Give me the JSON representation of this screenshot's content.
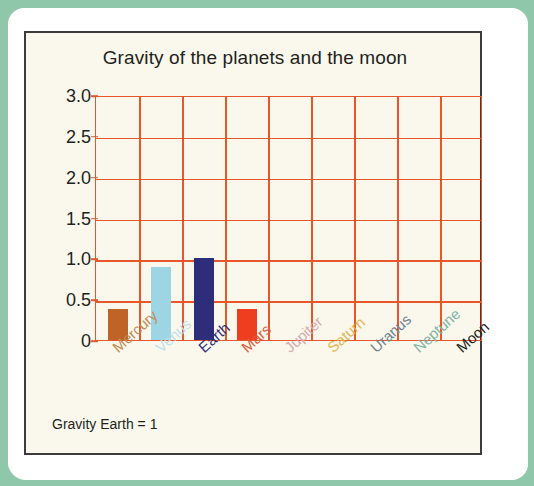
{
  "page": {
    "background_color": "#8fc7ab",
    "card_color": "#ffffff"
  },
  "panel": {
    "background_color": "#faf8ec",
    "border_color": "#3c3c3c",
    "footnote": "Gravity Earth = 1"
  },
  "chart_data": {
    "type": "bar",
    "title": "Gravity of the planets and the moon",
    "xlabel": "",
    "ylabel": "",
    "ylim": [
      0,
      3.0
    ],
    "yticks": [
      0,
      0.5,
      1.0,
      1.5,
      2.0,
      2.5,
      3.0
    ],
    "ytick_labels": [
      "0",
      "0.5",
      "1.0",
      "1.5",
      "2.0",
      "2.5",
      "3.0"
    ],
    "grid": true,
    "grid_color": "#e8572a",
    "legend": "none",
    "annotation": "Gravity Earth = 1",
    "categories": [
      "Mercury",
      "Venus",
      "Earth",
      "Mars",
      "Jupiter",
      "Saturn",
      "Uranus",
      "Neptune",
      "Moon"
    ],
    "values": [
      0.38,
      0.9,
      1.0,
      0.38,
      0,
      0,
      0,
      0,
      0
    ],
    "bar_colors": [
      "#bf6327",
      "#9ed5e5",
      "#2e2d7a",
      "#ef3d20",
      "#d9a7a7",
      "#e8c266",
      "#6c7b8b",
      "#7fb3a8",
      "#231f20"
    ],
    "label_colors": [
      "#c08b55",
      "#bfdfe9",
      "#2e2d7a",
      "#e2583a",
      "#d6a8b4",
      "#e3b755",
      "#70808f",
      "#7fb3a8",
      "#231f20"
    ]
  }
}
